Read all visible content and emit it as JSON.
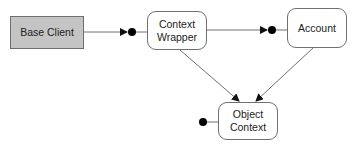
{
  "diagram": {
    "nodes": [
      {
        "id": "base-client",
        "label": "Base Client",
        "shape": "rect",
        "fill": "#c4c4c4"
      },
      {
        "id": "context-wrapper",
        "label": "Context\nWrapper",
        "shape": "rounded-rect",
        "fill": "#ffffff"
      },
      {
        "id": "account",
        "label": "Account",
        "shape": "rounded-rect",
        "fill": "#ffffff"
      },
      {
        "id": "object-context",
        "label": "Object\nContext",
        "shape": "rounded-rect",
        "fill": "#ffffff"
      }
    ],
    "edges": [
      {
        "from": "base-client",
        "to": "context-wrapper",
        "end": "arrow-to-ball-socket"
      },
      {
        "from": "context-wrapper",
        "to": "account",
        "end": "arrow-to-ball-socket"
      },
      {
        "from": "context-wrapper",
        "to": "object-context",
        "end": "arrow"
      },
      {
        "from": "account",
        "to": "object-context",
        "end": "arrow"
      }
    ],
    "interfaces": [
      {
        "node": "context-wrapper",
        "side": "left"
      },
      {
        "node": "account",
        "side": "left"
      },
      {
        "node": "object-context",
        "side": "left"
      }
    ],
    "colors": {
      "line": "#707070",
      "ball": "#000000",
      "rect_fill": "#c4c4c4"
    }
  }
}
